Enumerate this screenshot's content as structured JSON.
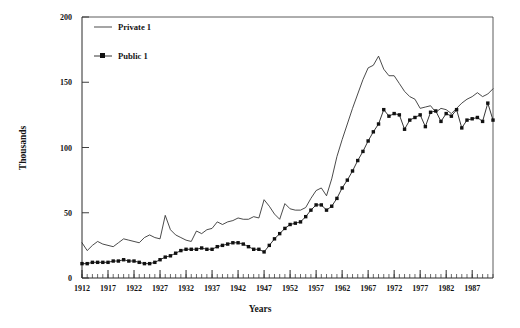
{
  "chart_data": {
    "type": "line",
    "title": "",
    "xlabel": "Years",
    "ylabel": "Thousands",
    "xlim": [
      1912,
      1991
    ],
    "ylim": [
      0,
      200
    ],
    "grid": false,
    "legend_position": "top-left-inside",
    "y_ticks": [
      0,
      50,
      100,
      150,
      200
    ],
    "y_tick_labels": [
      "0",
      "50",
      "100",
      "150",
      "200"
    ],
    "x_ticks": [
      1912,
      1917,
      1922,
      1927,
      1932,
      1937,
      1942,
      1947,
      1952,
      1957,
      1962,
      1967,
      1972,
      1977,
      1982,
      1987
    ],
    "x_tick_labels": [
      "1912",
      "1917",
      "1922",
      "1927",
      "1932",
      "1937",
      "1942",
      "1947",
      "1952",
      "1957",
      "1962",
      "1967",
      "1972",
      "1977",
      "1982",
      "1987"
    ],
    "minor_x_tick_interval": 1,
    "x": [
      1912,
      1913,
      1914,
      1915,
      1916,
      1917,
      1918,
      1919,
      1920,
      1921,
      1922,
      1923,
      1924,
      1925,
      1926,
      1927,
      1928,
      1929,
      1930,
      1931,
      1932,
      1933,
      1934,
      1935,
      1936,
      1937,
      1938,
      1939,
      1940,
      1941,
      1942,
      1943,
      1944,
      1945,
      1946,
      1947,
      1948,
      1949,
      1950,
      1951,
      1952,
      1953,
      1954,
      1955,
      1956,
      1957,
      1958,
      1959,
      1960,
      1961,
      1962,
      1963,
      1964,
      1965,
      1966,
      1967,
      1968,
      1969,
      1970,
      1971,
      1972,
      1973,
      1974,
      1975,
      1976,
      1977,
      1978,
      1979,
      1980,
      1981,
      1982,
      1983,
      1984,
      1985,
      1986,
      1987,
      1988,
      1989,
      1990,
      1991
    ],
    "series": [
      {
        "name": "Private 1",
        "marker": "none",
        "color": "#2b2b2b",
        "values": [
          27,
          21,
          25,
          28,
          26,
          25,
          24,
          27,
          30,
          29,
          28,
          27,
          31,
          33,
          31,
          30,
          48,
          37,
          33,
          31,
          29,
          28,
          36,
          34,
          37,
          38,
          43,
          41,
          43,
          44,
          46,
          45,
          45,
          47,
          46,
          60,
          55,
          49,
          45,
          57,
          53,
          52,
          52,
          54,
          61,
          67,
          69,
          63,
          76,
          93,
          106,
          118,
          130,
          141,
          152,
          161,
          163,
          170,
          160,
          155,
          155,
          149,
          143,
          139,
          137,
          130,
          131,
          132,
          127,
          130,
          129,
          126,
          130,
          134,
          137,
          139,
          142,
          139,
          141,
          145
        ]
      },
      {
        "name": "Public 1",
        "marker": "square",
        "color": "#111111",
        "values": [
          11,
          11,
          12,
          12,
          12,
          12,
          13,
          13,
          14,
          13,
          13,
          12,
          11,
          11,
          12,
          14,
          16,
          17,
          19,
          21,
          22,
          22,
          22,
          23,
          22,
          22,
          24,
          25,
          26,
          27,
          27,
          26,
          24,
          22,
          22,
          20,
          25,
          30,
          34,
          38,
          41,
          42,
          43,
          47,
          52,
          56,
          56,
          52,
          55,
          61,
          69,
          75,
          82,
          90,
          97,
          105,
          112,
          118,
          129,
          124,
          126,
          125,
          114,
          121,
          123,
          125,
          116,
          127,
          128,
          120,
          126,
          124,
          129,
          115,
          121,
          122,
          123,
          120,
          134,
          121
        ]
      }
    ]
  },
  "legend": {
    "items": [
      {
        "label": "Private 1",
        "style": "line"
      },
      {
        "label": "Public 1",
        "style": "line-square"
      }
    ]
  }
}
